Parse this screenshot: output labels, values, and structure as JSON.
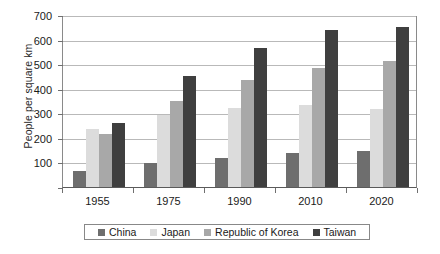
{
  "chart_data": {
    "type": "bar",
    "title": "",
    "subtitle": "",
    "xlabel": "",
    "ylabel": "People per square km",
    "categories": [
      "1955",
      "1975",
      "1990",
      "2010",
      "2020"
    ],
    "series": [
      {
        "name": "China",
        "color": "#6e6e6e",
        "values": [
          65,
          97,
          120,
          140,
          147
        ]
      },
      {
        "name": "Japan",
        "color": "#dcdcdc",
        "values": [
          235,
          293,
          320,
          335,
          317
        ]
      },
      {
        "name": "Republic of Korea",
        "color": "#a8a8a8",
        "values": [
          215,
          350,
          435,
          485,
          512
        ]
      },
      {
        "name": "Taiwan",
        "color": "#3f3f3f",
        "values": [
          260,
          450,
          565,
          640,
          650
        ]
      }
    ],
    "ylim": [
      0,
      700
    ],
    "yticks": [
      100,
      200,
      300,
      400,
      500,
      600,
      700
    ],
    "ytick_labels": [
      "100",
      "200",
      "300",
      "400",
      "500",
      "600",
      "700"
    ],
    "grid": true,
    "legend_position": "bottom"
  }
}
